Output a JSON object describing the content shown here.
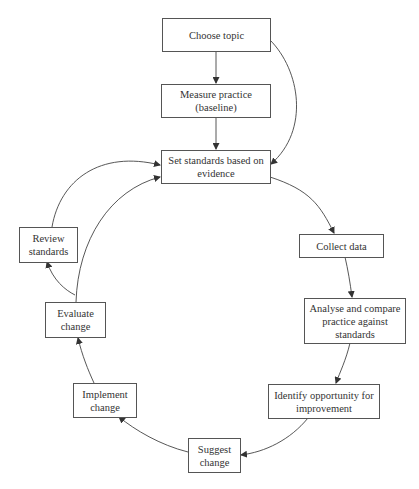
{
  "diagram": {
    "nodes": [
      {
        "id": "choose-topic",
        "label": "Choose topic"
      },
      {
        "id": "measure-practice",
        "label": "Measure practice (baseline)"
      },
      {
        "id": "set-standards",
        "label": "Set standards based on evidence"
      },
      {
        "id": "collect-data",
        "label": "Collect data"
      },
      {
        "id": "analyse-compare",
        "label": "Analyse and compare practice against standards"
      },
      {
        "id": "identify-opportunity",
        "label": "Identify opportunity for improvement"
      },
      {
        "id": "suggest-change",
        "label": "Suggest change"
      },
      {
        "id": "implement-change",
        "label": "Implement change"
      },
      {
        "id": "evaluate-change",
        "label": "Evaluate change"
      },
      {
        "id": "review-standards",
        "label": "Review standards"
      }
    ],
    "edges": [
      {
        "from": "choose-topic",
        "to": "measure-practice"
      },
      {
        "from": "choose-topic",
        "to": "set-standards"
      },
      {
        "from": "measure-practice",
        "to": "set-standards"
      },
      {
        "from": "set-standards",
        "to": "collect-data"
      },
      {
        "from": "collect-data",
        "to": "analyse-compare"
      },
      {
        "from": "analyse-compare",
        "to": "identify-opportunity"
      },
      {
        "from": "identify-opportunity",
        "to": "suggest-change"
      },
      {
        "from": "suggest-change",
        "to": "implement-change"
      },
      {
        "from": "implement-change",
        "to": "evaluate-change"
      },
      {
        "from": "evaluate-change",
        "to": "review-standards"
      },
      {
        "from": "evaluate-change",
        "to": "set-standards"
      },
      {
        "from": "review-standards",
        "to": "set-standards"
      }
    ]
  }
}
